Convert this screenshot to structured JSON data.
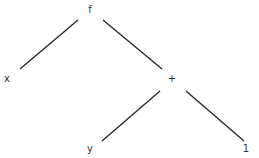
{
  "diagram": {
    "type": "expression-tree",
    "nodes": [
      {
        "id": "f",
        "label": "f",
        "x": 90,
        "y": 13
      },
      {
        "id": "x",
        "label": "x",
        "x": 7,
        "y": 82
      },
      {
        "id": "plus",
        "label": "+",
        "x": 172,
        "y": 82
      },
      {
        "id": "y",
        "label": "y",
        "x": 90,
        "y": 152
      },
      {
        "id": "one",
        "label": "1",
        "x": 246,
        "y": 152
      }
    ],
    "edges": [
      {
        "from": "f",
        "to": "x",
        "x1": 78,
        "y1": 20,
        "x2": 20,
        "y2": 69
      },
      {
        "from": "f",
        "to": "plus",
        "x1": 103,
        "y1": 20,
        "x2": 162,
        "y2": 69
      },
      {
        "from": "plus",
        "to": "y",
        "x1": 160,
        "y1": 91,
        "x2": 102,
        "y2": 141
      },
      {
        "from": "plus",
        "to": "one",
        "x1": 186,
        "y1": 91,
        "x2": 244,
        "y2": 141
      }
    ]
  }
}
